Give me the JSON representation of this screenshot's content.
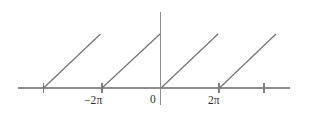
{
  "figure": {
    "title": "",
    "background_color": "#ffffff",
    "line_color": "#6f6f6f",
    "axis_color": "#8d8d8d",
    "label_color": "#2f2f2f",
    "width": 311,
    "height": 117
  },
  "labels": {
    "minus_two_pi": "−2π",
    "zero": "0",
    "two_pi": "2π"
  },
  "chart_data": {
    "type": "line",
    "title": "",
    "xlabel": "",
    "ylabel": "",
    "grid": false,
    "legend": null,
    "xlim": [
      -7.5,
      4.5
    ],
    "ylim": [
      0,
      1.15
    ],
    "x_tick_values": [
      -4.71,
      -3.14,
      0,
      3.14,
      6.28
    ],
    "x_tick_labels": [
      "",
      "−2π",
      "0",
      "2π",
      ""
    ],
    "y_tick_values": [],
    "y_tick_labels": [],
    "period": 6.283,
    "amplitude": 1,
    "series": [
      {
        "name": "sawtooth",
        "segments": [
          {
            "x": [
              -6.28,
              -3.14
            ],
            "y": [
              0,
              1
            ]
          },
          {
            "x": [
              -3.14,
              0.0
            ],
            "y": [
              0,
              1
            ]
          },
          {
            "x": [
              0.0,
              3.14
            ],
            "y": [
              0,
              1
            ]
          },
          {
            "x": [
              3.14,
              6.28
            ],
            "y": [
              0,
              1
            ]
          }
        ]
      }
    ]
  },
  "geometry": {
    "x_axis": {
      "x1": 18,
      "y1": 88,
      "x2": 290,
      "y2": 88
    },
    "y_axis": {
      "x1": 160.5,
      "y1": 12,
      "x2": 160.5,
      "y2": 105
    },
    "baseline_y": 88,
    "peak_y": 34,
    "ticks": [
      {
        "x": 43.5,
        "y_top": 83,
        "y_bottom": 93
      },
      {
        "x": 102.0,
        "y_top": 83,
        "y_bottom": 93
      },
      {
        "x": 219.0,
        "y_top": 83,
        "y_bottom": 93
      },
      {
        "x": 264.0,
        "y_top": 83,
        "y_bottom": 93
      }
    ],
    "ramps": [
      {
        "x1": 43.5,
        "y1": 88,
        "x2": 100.5,
        "y2": 34
      },
      {
        "x1": 102.0,
        "y1": 88,
        "x2": 160.0,
        "y2": 34
      },
      {
        "x1": 161.0,
        "y1": 88,
        "x2": 218.0,
        "y2": 34
      },
      {
        "x1": 219.5,
        "y1": 88,
        "x2": 276.0,
        "y2": 34
      }
    ],
    "label_positions": {
      "minus_two_pi": {
        "left": 84,
        "top": 95
      },
      "zero": {
        "left": 150,
        "top": 94
      },
      "two_pi": {
        "left": 208,
        "top": 95
      }
    }
  }
}
